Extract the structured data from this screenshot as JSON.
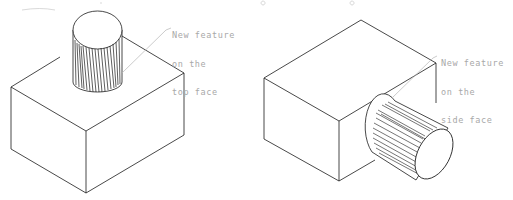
{
  "figure": {
    "caption_clipped": "",
    "colors": {
      "line": "#1a1a1a",
      "leader": "#b5b5b5",
      "text": "#a8a8a8",
      "background": "#ffffff"
    }
  },
  "left_view": {
    "label_lines": [
      "New feature",
      "on the",
      "top face"
    ]
  },
  "right_view": {
    "label_lines": [
      "New feature",
      "on the",
      "side face"
    ]
  }
}
